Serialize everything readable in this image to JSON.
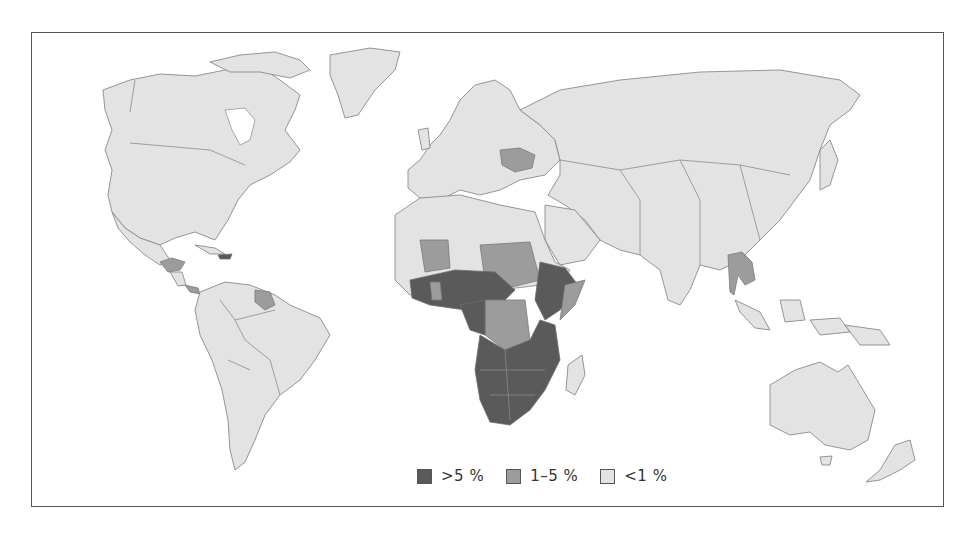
{
  "map": {
    "type": "choropleth-world",
    "colors": {
      "background": "#ffffff",
      "land_default": "#e3e3e3",
      "border": "#8a8a8a",
      "frame": "#555555"
    },
    "legend": [
      {
        "label": ">5 %",
        "color": "#5a5a5a",
        "class": "high"
      },
      {
        "label": "1–5 %",
        "color": "#9c9c9c",
        "class": "mid"
      },
      {
        "label": "<1 %",
        "color": "#e3e3e3",
        "class": "low"
      }
    ],
    "regions_high": [
      "Haiti",
      "Southern Africa",
      "East Africa",
      "Central Africa (parts)",
      "West Africa (parts)",
      "Ethiopia",
      "Nigeria",
      "Cameroon",
      "Uganda",
      "Kenya",
      "Tanzania",
      "Zambia",
      "Zimbabwe",
      "Mozambique",
      "Malawi",
      "South Africa",
      "Botswana",
      "Namibia",
      "Angola",
      "Lesotho",
      "Swaziland",
      "Central African Republic",
      "Côte d'Ivoire",
      "Burkina Faso"
    ],
    "regions_mid": [
      "Guatemala",
      "Honduras",
      "Belize",
      "Panama",
      "Guyana",
      "Suriname",
      "Ukraine",
      "Thailand",
      "Cambodia",
      "Mali",
      "Chad",
      "Sudan",
      "DR Congo",
      "Somalia",
      "Ghana",
      "Senegal",
      "Guinea",
      "Sierra Leone",
      "Gabon"
    ]
  }
}
